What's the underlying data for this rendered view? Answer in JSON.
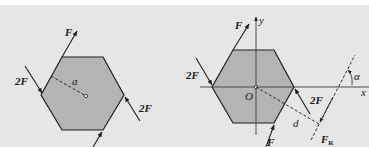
{
  "colors": {
    "background": "#e6e6e6",
    "hexagon_fill": "#b4b4b4",
    "line": "#1e1e1e"
  },
  "left_figure": {
    "labels": {
      "force_top": "F",
      "force_left": "2F",
      "force_right": "2F",
      "radius": "a"
    }
  },
  "right_figure": {
    "labels": {
      "force_top": "F",
      "force_left": "2F",
      "force_right": "2F",
      "force_bottom": "F",
      "origin": "O",
      "x_axis": "x",
      "y_axis": "y",
      "distance": "d",
      "resultant": "F",
      "resultant_sub": "R",
      "angle": "α"
    }
  }
}
